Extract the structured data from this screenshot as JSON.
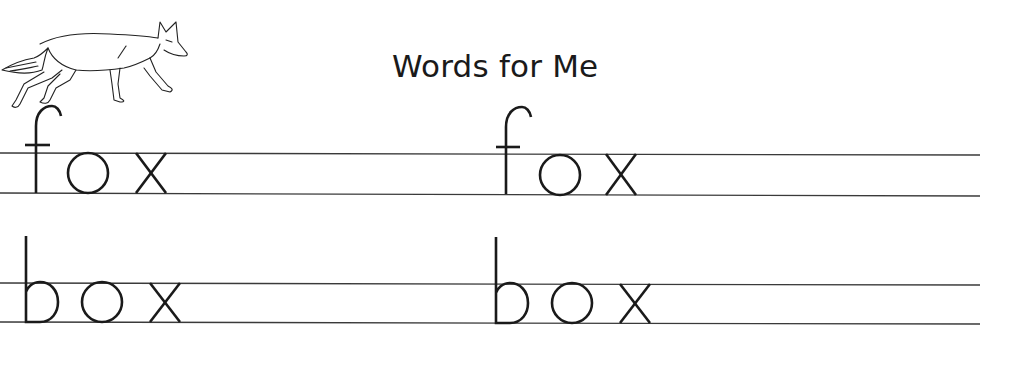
{
  "worksheet": {
    "title": "Words for Me",
    "illustration": "fox-drawing",
    "rows": [
      {
        "word": "fox",
        "model": "fox",
        "trace": "fox"
      },
      {
        "word": "box",
        "model": "box",
        "trace": "box"
      }
    ],
    "line_color": "#3a3a3a",
    "ink_color": "#1a1a1a"
  }
}
